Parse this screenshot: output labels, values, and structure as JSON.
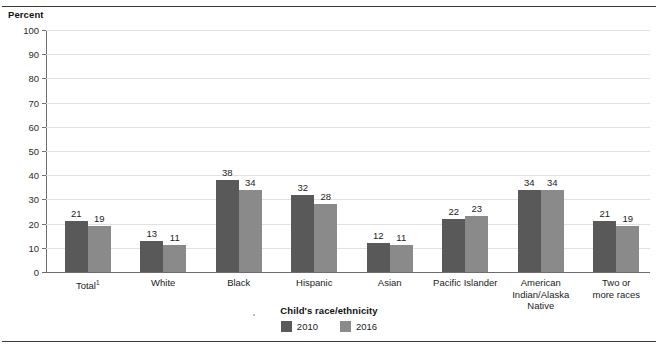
{
  "chart_data": {
    "type": "bar",
    "title": "",
    "ylabel": "Percent",
    "xlabel": "Child's race/ethnicity",
    "ylim": [
      0,
      100
    ],
    "ytick_step": 10,
    "yticks": [
      0,
      10,
      20,
      30,
      40,
      50,
      60,
      70,
      80,
      90,
      100
    ],
    "grid": true,
    "legend_position": "bottom",
    "categories": [
      "Total¹",
      "White",
      "Black",
      "Hispanic",
      "Asian",
      "Pacific Islander",
      "American Indian/Alaska Native",
      "Two or more races"
    ],
    "category_lines": [
      [
        "Total¹"
      ],
      [
        "White"
      ],
      [
        "Black"
      ],
      [
        "Hispanic"
      ],
      [
        "Asian"
      ],
      [
        "Pacific Islander"
      ],
      [
        "American",
        "Indian/Alaska",
        "Native"
      ],
      [
        "Two or",
        "more races"
      ]
    ],
    "series": [
      {
        "name": "2010",
        "color": "#595959",
        "values": [
          21,
          13,
          38,
          32,
          12,
          22,
          34,
          21
        ]
      },
      {
        "name": "2016",
        "color": "#8a8a8a",
        "values": [
          19,
          11,
          34,
          28,
          11,
          23,
          34,
          19
        ]
      }
    ],
    "footnote_marker": "1"
  },
  "colors": {
    "series_2010": "#595959",
    "series_2016": "#8a8a8a",
    "gridline": "#e2e2e2",
    "axis": "#6d6d6d",
    "rule": "#3a3a3a",
    "text": "#1b1b1b",
    "background": "#ffffff"
  }
}
